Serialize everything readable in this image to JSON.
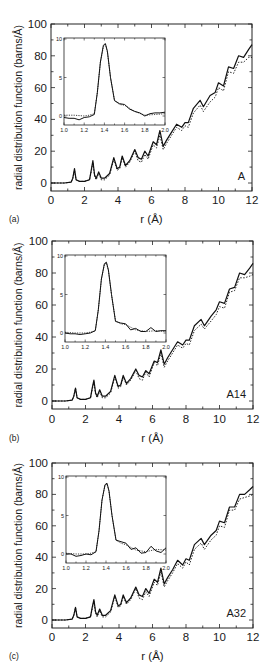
{
  "figure": {
    "ylabel": "radial distribution function (barns/Å)",
    "xlabel": "r (Å)",
    "xticks": [
      0,
      2,
      4,
      6,
      8,
      10,
      12
    ],
    "yticks": [
      0,
      20,
      40,
      60,
      80,
      100
    ],
    "inset_xticks": [
      "1.0",
      "1.2",
      "1.4",
      "1.6",
      "1.8",
      "2.0"
    ],
    "inset_yticks": [
      "0",
      "5",
      "10"
    ]
  },
  "chart_data": [
    {
      "type": "line",
      "panel_label": "(a)",
      "sample_label": "A",
      "xlabel": "r (Å)",
      "ylabel": "radial distribution function (barns/Å)",
      "xlim": [
        0,
        12
      ],
      "ylim": [
        -3,
        100
      ],
      "grid": false,
      "series": [
        {
          "name": "experiment (solid)",
          "x": [
            0,
            0.8,
            1.2,
            1.3,
            1.4,
            1.5,
            1.7,
            2.0,
            2.3,
            2.4,
            2.5,
            2.6,
            2.7,
            2.85,
            3.0,
            3.2,
            3.5,
            3.75,
            3.95,
            4.1,
            4.25,
            4.45,
            4.7,
            5.0,
            5.2,
            5.4,
            5.6,
            5.8,
            6.1,
            6.3,
            6.5,
            6.7,
            6.9,
            7.2,
            7.5,
            7.8,
            8.0,
            8.2,
            8.5,
            8.9,
            9.1,
            9.5,
            9.8,
            10.0,
            10.3,
            10.6,
            10.9,
            11.2,
            11.5,
            11.8,
            12.0
          ],
          "y": [
            0,
            0,
            0.5,
            3,
            9,
            2,
            1,
            1,
            2,
            8,
            14,
            5,
            3,
            7,
            3,
            3,
            6,
            16,
            9,
            10,
            17,
            11,
            14,
            21,
            16,
            15,
            20,
            17,
            26,
            24,
            33,
            23,
            27,
            32,
            37,
            35,
            38,
            38,
            47,
            52,
            48,
            55,
            57,
            63,
            61,
            73,
            72,
            80,
            79,
            84,
            87
          ]
        },
        {
          "name": "model (dotted)",
          "x": [
            0,
            0.8,
            1.2,
            1.3,
            1.4,
            1.5,
            1.7,
            2.0,
            2.3,
            2.4,
            2.5,
            2.6,
            2.7,
            2.85,
            3.0,
            3.2,
            3.5,
            3.75,
            3.95,
            4.1,
            4.25,
            4.45,
            4.7,
            5.0,
            5.2,
            5.4,
            5.6,
            5.8,
            6.1,
            6.3,
            6.5,
            6.7,
            6.9,
            7.2,
            7.5,
            7.8,
            8.0,
            8.2,
            8.5,
            8.9,
            9.1,
            9.5,
            9.8,
            10.0,
            10.3,
            10.6,
            10.9,
            11.2,
            11.5,
            11.8,
            12.0
          ],
          "y": [
            0,
            0,
            0.5,
            3,
            8,
            2,
            1,
            1,
            2,
            7,
            13,
            4,
            2,
            6,
            2,
            2,
            5,
            15,
            8,
            9,
            16,
            10,
            13,
            20,
            14,
            13,
            18,
            15,
            24,
            22,
            30,
            21,
            25,
            30,
            35,
            33,
            36,
            35,
            44,
            49,
            45,
            51,
            54,
            60,
            58,
            70,
            69,
            76,
            76,
            79,
            79
          ]
        }
      ],
      "inset": {
        "xlim": [
          1.0,
          2.0
        ],
        "ylim": [
          -1,
          10
        ],
        "series": [
          {
            "name": "experiment (solid)",
            "x": [
              1.0,
              1.05,
              1.1,
              1.15,
              1.2,
              1.25,
              1.3,
              1.33,
              1.36,
              1.39,
              1.41,
              1.43,
              1.46,
              1.5,
              1.55,
              1.6,
              1.65,
              1.7,
              1.75,
              1.8,
              1.85,
              1.9,
              1.95,
              2.0
            ],
            "y": [
              -0.2,
              -0.3,
              -0.3,
              -0.5,
              -0.2,
              -0.1,
              0.2,
              3.0,
              7.0,
              9.2,
              9.4,
              8.4,
              5.0,
              2.0,
              1.6,
              1.5,
              0.9,
              0.6,
              0.4,
              0.0,
              0.3,
              0.4,
              0.4,
              0.5
            ]
          },
          {
            "name": "model (dotted)",
            "x": [
              1.0,
              1.1,
              1.2,
              1.25,
              1.3,
              1.33,
              1.36,
              1.39,
              1.41,
              1.43,
              1.46,
              1.5,
              1.55,
              1.6,
              1.7,
              1.8,
              1.9,
              2.0
            ],
            "y": [
              0.1,
              0.1,
              0.0,
              0.1,
              0.3,
              3.0,
              7.0,
              9.0,
              9.3,
              8.3,
              5.0,
              2.0,
              1.5,
              1.4,
              0.6,
              0.1,
              0.2,
              0.3
            ]
          }
        ]
      }
    },
    {
      "type": "line",
      "panel_label": "(b)",
      "sample_label": "A14",
      "xlabel": "r (Å)",
      "ylabel": "radial distribution function (barns/Å)",
      "xlim": [
        0,
        12
      ],
      "ylim": [
        -3,
        100
      ],
      "grid": false,
      "series": [
        {
          "name": "experiment (solid)",
          "x": [
            0,
            0.8,
            1.2,
            1.3,
            1.4,
            1.5,
            1.7,
            2.0,
            2.3,
            2.4,
            2.5,
            2.6,
            2.7,
            2.85,
            3.0,
            3.2,
            3.5,
            3.75,
            3.95,
            4.1,
            4.25,
            4.45,
            4.7,
            5.0,
            5.2,
            5.4,
            5.6,
            5.8,
            6.1,
            6.3,
            6.5,
            6.7,
            6.9,
            7.2,
            7.5,
            7.8,
            8.0,
            8.2,
            8.5,
            8.9,
            9.1,
            9.5,
            9.8,
            10.0,
            10.3,
            10.6,
            10.9,
            11.2,
            11.5,
            11.8,
            12.0
          ],
          "y": [
            0,
            0,
            0.5,
            3,
            8,
            2,
            1,
            1,
            2,
            8,
            13,
            5,
            3,
            7,
            3,
            3,
            6,
            16,
            9,
            10,
            16,
            11,
            14,
            20,
            16,
            15,
            19,
            17,
            25,
            24,
            32,
            23,
            27,
            32,
            37,
            35,
            38,
            38,
            47,
            51,
            47,
            53,
            57,
            62,
            61,
            70,
            71,
            80,
            79,
            83,
            86
          ]
        },
        {
          "name": "model (dotted)",
          "x": [
            0,
            0.8,
            1.2,
            1.3,
            1.4,
            1.5,
            1.7,
            2.0,
            2.3,
            2.4,
            2.5,
            2.6,
            2.7,
            2.85,
            3.0,
            3.2,
            3.5,
            3.75,
            3.95,
            4.1,
            4.25,
            4.45,
            4.7,
            5.0,
            5.2,
            5.4,
            5.6,
            5.8,
            6.1,
            6.3,
            6.5,
            6.7,
            6.9,
            7.2,
            7.5,
            7.8,
            8.0,
            8.2,
            8.5,
            8.9,
            9.1,
            9.5,
            9.8,
            10.0,
            10.3,
            10.6,
            10.9,
            11.2,
            11.5,
            11.8,
            12.0
          ],
          "y": [
            0,
            0,
            0.5,
            3,
            8,
            2,
            1,
            1,
            2,
            7,
            12,
            4,
            2,
            6,
            2,
            2,
            5,
            15,
            8,
            9,
            15,
            10,
            13,
            19,
            14,
            13,
            18,
            15,
            24,
            22,
            30,
            21,
            25,
            30,
            35,
            33,
            36,
            35,
            44,
            48,
            45,
            50,
            54,
            59,
            58,
            68,
            69,
            77,
            77,
            78,
            79
          ]
        }
      ],
      "inset": {
        "xlim": [
          1.0,
          2.0
        ],
        "ylim": [
          -1,
          10
        ],
        "series": [
          {
            "name": "experiment (solid)",
            "x": [
              1.0,
              1.05,
              1.1,
              1.15,
              1.2,
              1.25,
              1.3,
              1.33,
              1.36,
              1.39,
              1.41,
              1.43,
              1.46,
              1.5,
              1.55,
              1.6,
              1.65,
              1.7,
              1.75,
              1.8,
              1.85,
              1.9,
              1.95,
              2.0
            ],
            "y": [
              0.0,
              -0.1,
              -0.1,
              -0.2,
              -0.1,
              0.0,
              0.3,
              3.0,
              7.0,
              9.0,
              9.2,
              8.2,
              5.0,
              1.5,
              1.3,
              1.2,
              0.4,
              0.6,
              0.2,
              0.2,
              0.7,
              0.2,
              0.3,
              0.3
            ]
          },
          {
            "name": "model (dotted)",
            "x": [
              1.0,
              1.1,
              1.2,
              1.25,
              1.3,
              1.33,
              1.36,
              1.39,
              1.41,
              1.43,
              1.46,
              1.5,
              1.55,
              1.6,
              1.7,
              1.8,
              1.9,
              2.0
            ],
            "y": [
              0.1,
              0.0,
              0.0,
              0.1,
              0.3,
              3.0,
              7.0,
              8.9,
              9.1,
              8.1,
              5.0,
              1.6,
              1.2,
              1.1,
              0.4,
              0.2,
              0.3,
              0.2
            ]
          }
        ]
      }
    },
    {
      "type": "line",
      "panel_label": "(c)",
      "sample_label": "A32",
      "xlabel": "r (Å)",
      "ylabel": "radial distribution function (barns/Å)",
      "xlim": [
        0,
        12
      ],
      "ylim": [
        -3,
        100
      ],
      "grid": false,
      "series": [
        {
          "name": "experiment (solid)",
          "x": [
            0,
            0.8,
            1.2,
            1.3,
            1.4,
            1.5,
            1.7,
            2.0,
            2.3,
            2.4,
            2.5,
            2.6,
            2.7,
            2.85,
            3.0,
            3.2,
            3.5,
            3.75,
            3.95,
            4.1,
            4.25,
            4.45,
            4.7,
            5.0,
            5.2,
            5.4,
            5.6,
            5.8,
            6.1,
            6.3,
            6.5,
            6.7,
            6.9,
            7.2,
            7.5,
            7.8,
            8.0,
            8.2,
            8.5,
            8.9,
            9.1,
            9.5,
            9.8,
            10.0,
            10.3,
            10.6,
            10.9,
            11.2,
            11.5,
            11.8,
            12.0
          ],
          "y": [
            0,
            0,
            0.5,
            3,
            8,
            2,
            1,
            1,
            2,
            8,
            13,
            5,
            3,
            7,
            3,
            3,
            6,
            16,
            9,
            10,
            16,
            11,
            14,
            21,
            16,
            15,
            20,
            17,
            26,
            24,
            33,
            23,
            27,
            32,
            38,
            35,
            39,
            38,
            48,
            52,
            48,
            54,
            57,
            63,
            62,
            72,
            72,
            80,
            80,
            83,
            85
          ]
        },
        {
          "name": "model (dotted)",
          "x": [
            0,
            0.8,
            1.2,
            1.3,
            1.4,
            1.5,
            1.7,
            2.0,
            2.3,
            2.4,
            2.5,
            2.6,
            2.7,
            2.85,
            3.0,
            3.2,
            3.5,
            3.75,
            3.95,
            4.1,
            4.25,
            4.45,
            4.7,
            5.0,
            5.2,
            5.4,
            5.6,
            5.8,
            6.1,
            6.3,
            6.5,
            6.7,
            6.9,
            7.2,
            7.5,
            7.8,
            8.0,
            8.2,
            8.5,
            8.9,
            9.1,
            9.5,
            9.8,
            10.0,
            10.3,
            10.6,
            10.9,
            11.2,
            11.5,
            11.8,
            12.0
          ],
          "y": [
            0,
            0,
            0.5,
            3,
            8,
            2,
            1,
            1,
            2,
            7,
            12,
            4,
            2,
            6,
            2,
            2,
            5,
            15,
            8,
            9,
            15,
            10,
            13,
            20,
            14,
            13,
            18,
            15,
            24,
            22,
            31,
            21,
            25,
            30,
            36,
            33,
            37,
            35,
            45,
            49,
            45,
            51,
            54,
            60,
            59,
            70,
            70,
            77,
            78,
            79,
            80
          ]
        }
      ],
      "inset": {
        "xlim": [
          1.0,
          2.0
        ],
        "ylim": [
          -1,
          10
        ],
        "series": [
          {
            "name": "experiment (solid)",
            "x": [
              1.0,
              1.05,
              1.1,
              1.15,
              1.2,
              1.25,
              1.3,
              1.33,
              1.36,
              1.39,
              1.41,
              1.43,
              1.46,
              1.5,
              1.55,
              1.6,
              1.65,
              1.7,
              1.75,
              1.8,
              1.85,
              1.9,
              1.95,
              2.0
            ],
            "y": [
              0.0,
              0.0,
              -0.3,
              -0.2,
              0.0,
              -0.1,
              0.3,
              3.0,
              7.0,
              9.0,
              9.2,
              8.2,
              5.0,
              1.8,
              1.6,
              1.4,
              0.6,
              0.8,
              0.1,
              0.2,
              1.0,
              0.4,
              0.2,
              0.8
            ]
          },
          {
            "name": "model (dotted)",
            "x": [
              1.0,
              1.1,
              1.2,
              1.25,
              1.3,
              1.33,
              1.36,
              1.39,
              1.41,
              1.43,
              1.46,
              1.5,
              1.55,
              1.6,
              1.7,
              1.8,
              1.9,
              2.0
            ],
            "y": [
              0.1,
              0.0,
              0.0,
              0.1,
              0.3,
              3.0,
              7.0,
              8.9,
              9.1,
              8.1,
              5.0,
              1.8,
              1.4,
              1.2,
              0.5,
              0.3,
              0.6,
              0.5
            ]
          }
        ]
      }
    }
  ],
  "layout": {
    "panels": [
      {
        "left": 51,
        "right": 252,
        "top": 24,
        "zero": 183,
        "bottom": 191,
        "inset": {
          "left": 64,
          "right": 165,
          "top": 38,
          "bottom": 125
        },
        "tick_y": 200,
        "label_y": 219
      },
      {
        "left": 52,
        "right": 253,
        "top": 241,
        "zero": 401,
        "bottom": 409,
        "inset": {
          "left": 65,
          "right": 166,
          "top": 255,
          "bottom": 342
        },
        "tick_y": 419,
        "label_y": 438
      },
      {
        "left": 52,
        "right": 253,
        "top": 463,
        "zero": 620,
        "bottom": 628,
        "inset": {
          "left": 66,
          "right": 166,
          "top": 476,
          "bottom": 563
        },
        "tick_y": 637,
        "label_y": 656
      }
    ]
  }
}
